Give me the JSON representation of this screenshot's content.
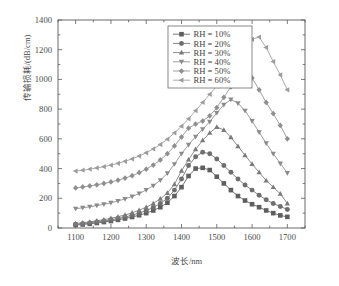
{
  "chart_data": {
    "type": "line",
    "title": "",
    "xlabel": "波长/nm",
    "ylabel": "传输损耗/(dB/cm)",
    "xlim": [
      1050,
      1750
    ],
    "ylim": [
      0,
      1400
    ],
    "xticks": [
      1100,
      1200,
      1300,
      1400,
      1500,
      1600,
      1700
    ],
    "yticks": [
      0,
      200,
      400,
      600,
      800,
      1000,
      1200,
      1400
    ],
    "xtick_labels": [
      "1100",
      "1200",
      "1300",
      "1400",
      "1500",
      "1600",
      "1700"
    ],
    "ytick_labels": [
      "0",
      "200",
      "400",
      "600",
      "800",
      "1000",
      "1200",
      "1400"
    ],
    "xminor_step": 50,
    "yminor_step": 100,
    "grid": false,
    "legend_position": "top-center-right",
    "legend_border": true,
    "x": [
      1100,
      1120,
      1140,
      1160,
      1180,
      1200,
      1220,
      1240,
      1260,
      1280,
      1300,
      1320,
      1340,
      1360,
      1380,
      1400,
      1420,
      1440,
      1460,
      1480,
      1500,
      1520,
      1540,
      1560,
      1580,
      1600,
      1620,
      1640,
      1660,
      1680,
      1700
    ],
    "series": [
      {
        "name": "RH = 10%",
        "label": "RH = 10%",
        "marker": "square",
        "color": "#5e5e5e",
        "values": [
          20,
          24,
          28,
          34,
          40,
          47,
          55,
          64,
          74,
          86,
          100,
          118,
          140,
          170,
          215,
          275,
          350,
          400,
          405,
          390,
          345,
          300,
          255,
          215,
          185,
          160,
          140,
          118,
          100,
          85,
          75
        ]
      },
      {
        "name": "RH = 20%",
        "label": "RH = 20%",
        "marker": "circle",
        "color": "#6e6e6e",
        "values": [
          25,
          29,
          34,
          40,
          47,
          55,
          64,
          74,
          86,
          100,
          117,
          138,
          165,
          200,
          255,
          330,
          420,
          480,
          510,
          500,
          465,
          420,
          375,
          330,
          290,
          255,
          220,
          190,
          165,
          145,
          125
        ]
      },
      {
        "name": "RH = 30%",
        "label": "RH = 30%",
        "marker": "triangle-up",
        "color": "#7a7a7a",
        "values": [
          30,
          35,
          41,
          48,
          56,
          65,
          76,
          88,
          102,
          120,
          140,
          165,
          196,
          236,
          295,
          385,
          460,
          530,
          590,
          640,
          680,
          660,
          610,
          550,
          490,
          430,
          375,
          320,
          275,
          230,
          165
        ]
      },
      {
        "name": "RH = 40%",
        "label": "RH = 40%",
        "marker": "triangle-down",
        "color": "#8a8a8a",
        "values": [
          130,
          136,
          143,
          151,
          160,
          170,
          182,
          196,
          212,
          232,
          256,
          285,
          322,
          368,
          430,
          500,
          560,
          615,
          665,
          715,
          775,
          830,
          865,
          840,
          790,
          720,
          645,
          570,
          500,
          435,
          370
        ]
      },
      {
        "name": "RH = 50%",
        "label": "RH = 50%",
        "marker": "diamond",
        "color": "#8f8f8f",
        "values": [
          270,
          276,
          283,
          291,
          300,
          310,
          322,
          336,
          352,
          372,
          396,
          424,
          458,
          500,
          552,
          612,
          672,
          700,
          720,
          755,
          810,
          880,
          950,
          1005,
          1040,
          1010,
          930,
          845,
          770,
          690,
          600
        ]
      },
      {
        "name": "RH = 60%",
        "label": "RH = 60%",
        "marker": "triangle-left",
        "color": "#9c9c9c",
        "values": [
          383,
          389,
          396,
          404,
          413,
          423,
          435,
          449,
          465,
          484,
          506,
          532,
          562,
          598,
          640,
          685,
          735,
          790,
          845,
          900,
          955,
          1020,
          1090,
          1160,
          1225,
          1270,
          1285,
          1215,
          1120,
          1030,
          930
        ]
      }
    ]
  }
}
